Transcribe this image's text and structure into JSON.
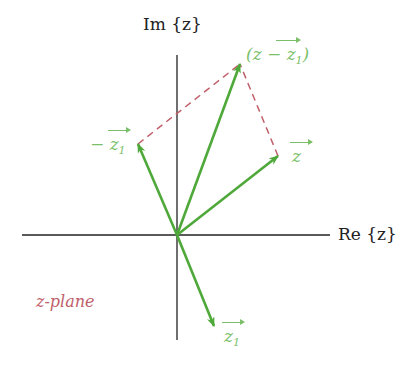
{
  "diagram": {
    "axes": {
      "x_label": "Re {z}",
      "y_label": "Im {z}"
    },
    "plane_label": "z-plane",
    "vectors": [
      {
        "name": "z",
        "label": "z",
        "tip": [
          278,
          156
        ]
      },
      {
        "name": "z1",
        "label": "z",
        "subscript": "1",
        "tip": [
          214,
          326
        ]
      },
      {
        "name": "neg-z1",
        "label": "− z",
        "subscript": "1",
        "tip": [
          138,
          144
        ]
      },
      {
        "name": "z-minus-z1",
        "label": "(z − z",
        "subscript": "1",
        "suffix": ")",
        "tip": [
          240,
          64
        ]
      }
    ],
    "origin": [
      177,
      235
    ],
    "colors": {
      "vector": "#4fa83a",
      "vector_label": "#7cbf6a",
      "dashed": "#c0606a",
      "axis": "#222222"
    }
  }
}
